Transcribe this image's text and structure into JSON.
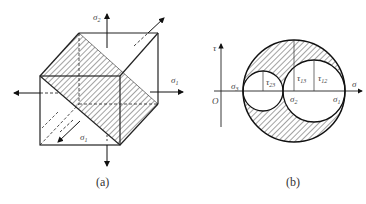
{
  "figure_a": {
    "caption": "(a)",
    "labels": {
      "top_stress": "σ",
      "top_stress_sub": "2",
      "right_stress": "σ",
      "right_stress_sub": "1",
      "bottom_stress": "σ",
      "bottom_stress_sub": "1"
    }
  },
  "figure_b": {
    "caption": "(b)",
    "axis": {
      "x_label": "σ",
      "y_label": "τ",
      "origin": "O"
    },
    "labels": {
      "sigma3": "σ",
      "sigma3_sub": "3",
      "sigma2": "σ",
      "sigma2_sub": "2",
      "sigma1": "σ",
      "sigma1_sub": "1",
      "tau23": "τ",
      "tau23_sub": "23",
      "tau13": "τ",
      "tau13_sub": "13",
      "tau12": "τ",
      "tau12_sub": "12"
    }
  },
  "colors": {
    "line": "#222222",
    "hatch": "#333333",
    "label": "#444444"
  }
}
